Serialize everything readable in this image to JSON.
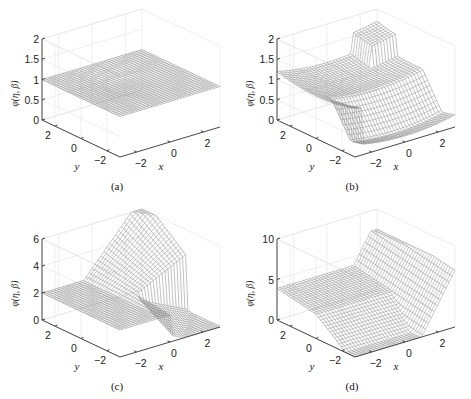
{
  "figure": {
    "panels": [
      {
        "id": "a",
        "caption": "(a)",
        "zlabel": "φ(η, β)",
        "xlabel": "x",
        "ylabel": "y",
        "zticks": [
          "0",
          "0.5",
          "1",
          "1.5",
          "2"
        ],
        "zmax": 2,
        "xticks": [
          "−2",
          "0",
          "2"
        ],
        "yticks": [
          "2",
          "0",
          "−2"
        ]
      },
      {
        "id": "b",
        "caption": "(b)",
        "zlabel": "φ(η, β)",
        "xlabel": "x",
        "ylabel": "y",
        "zticks": [
          "0",
          "0.5",
          "1",
          "1.5",
          "2"
        ],
        "zmax": 2,
        "xticks": [
          "−2",
          "0",
          "2"
        ],
        "yticks": [
          "2",
          "0",
          "−2"
        ]
      },
      {
        "id": "c",
        "caption": "(c)",
        "zlabel": "φ(η, β)",
        "xlabel": "x",
        "ylabel": "y",
        "zticks": [
          "0",
          "2",
          "4",
          "6"
        ],
        "zmax": 6,
        "xticks": [
          "−2",
          "0",
          "2"
        ],
        "yticks": [
          "2",
          "0",
          "−2"
        ]
      },
      {
        "id": "d",
        "caption": "(d)",
        "zlabel": "φ(η, β)",
        "xlabel": "x",
        "ylabel": "y",
        "zticks": [
          "0",
          "5",
          "10"
        ],
        "zmax": 10,
        "xticks": [
          "−2",
          "0",
          "2"
        ],
        "yticks": [
          "2",
          "0",
          "−2"
        ]
      }
    ]
  },
  "chart_data": [
    {
      "type": "surface",
      "title": "(a)",
      "xlabel": "x",
      "ylabel": "y",
      "zlabel": "φ(η, β)",
      "xlim": [
        -3,
        3
      ],
      "ylim": [
        -3,
        3
      ],
      "zlim": [
        0,
        2
      ],
      "zticks": [
        0,
        0.5,
        1,
        1.5,
        2
      ],
      "xticks": [
        -2,
        0,
        2
      ],
      "yticks": [
        -2,
        0,
        2
      ],
      "grid": true,
      "description": "Nearly flat surface at φ≈1 over the whole domain"
    },
    {
      "type": "surface",
      "title": "(b)",
      "xlabel": "x",
      "ylabel": "y",
      "zlabel": "φ(η, β)",
      "xlim": [
        -3,
        3
      ],
      "ylim": [
        -3,
        3
      ],
      "zlim": [
        0,
        2
      ],
      "zticks": [
        0,
        0.5,
        1,
        1.5,
        2
      ],
      "xticks": [
        -2,
        0,
        2
      ],
      "yticks": [
        -2,
        0,
        2
      ],
      "grid": true,
      "description": "Saddle/bowl: corners rise to ~1.5–2, dips to ~0 near x,y<0 edge"
    },
    {
      "type": "surface",
      "title": "(c)",
      "xlabel": "x",
      "ylabel": "y",
      "zlabel": "φ(η, β)",
      "xlim": [
        -3,
        3
      ],
      "ylim": [
        -3,
        3
      ],
      "zlim": [
        0,
        6
      ],
      "zticks": [
        0,
        2,
        4,
        6
      ],
      "xticks": [
        -2,
        0,
        2
      ],
      "yticks": [
        -2,
        0,
        2
      ],
      "grid": true,
      "description": "Surface ~2 on left, rising ridge to ~6 at back-right, dipping to ~0 at front-right"
    },
    {
      "type": "surface",
      "title": "(d)",
      "xlabel": "x",
      "ylabel": "y",
      "zlabel": "φ(η, β)",
      "xlim": [
        -3,
        3
      ],
      "ylim": [
        -3,
        3
      ],
      "zlim": [
        0,
        10
      ],
      "zticks": [
        0,
        5,
        10
      ],
      "xticks": [
        -2,
        0,
        2
      ],
      "yticks": [
        -2,
        0,
        2
      ],
      "grid": true,
      "description": "Surface ~3–4 at back-left, ~0 along front, sharp rise to ~7 at right"
    }
  ]
}
